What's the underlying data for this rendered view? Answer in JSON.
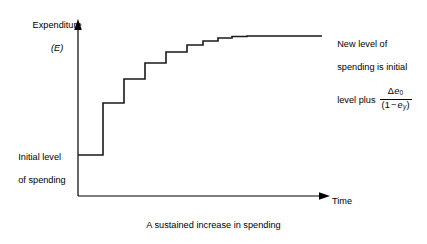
{
  "figure": {
    "caption": "A sustained increase in spending",
    "axes": {
      "y_label_line1": "Expenditure",
      "y_label_line2": "(E)",
      "y_symbol": "E",
      "x_label": "Time",
      "axis_color": "#000000",
      "origin_x": 78,
      "origin_y": 196,
      "y_axis_top": 20,
      "x_axis_right": 330
    },
    "labels": {
      "initial_level": "Initial level\nof spending",
      "initial_level_line1": "Initial level",
      "initial_level_line2": "of spending",
      "annotation_line1": "New level of",
      "annotation_line2": "spending is initial",
      "annotation_line3": "level plus",
      "formula_numerator": "Δe₀",
      "formula_denominator": "(1 − eᵧ)",
      "formula_numerator_symbol": "Δe",
      "formula_numerator_subscript": "0",
      "formula_denominator_prefix": "(1 − e",
      "formula_denominator_subscript": "y",
      "formula_denominator_suffix": ")"
    },
    "leader_line": {
      "from_x": 247,
      "to_x": 322,
      "y": 36
    },
    "curve": {
      "color": "#1a1a1a",
      "stroke_width": 1.6,
      "description": "Step function: expenditure rises in geometrically decaying increments from an initial plateau to a new higher plateau"
    }
  },
  "chart_data": {
    "type": "line",
    "title": "A sustained increase in spending",
    "xlabel": "Time",
    "ylabel": "Expenditure (E)",
    "grid": false,
    "legend": "none",
    "series": [
      {
        "name": "Expenditure path",
        "step": "post",
        "points_px": [
          {
            "x": 78,
            "y": 155
          },
          {
            "x": 103,
            "y": 155
          },
          {
            "x": 103,
            "y": 103
          },
          {
            "x": 124,
            "y": 103
          },
          {
            "x": 124,
            "y": 79
          },
          {
            "x": 145,
            "y": 79
          },
          {
            "x": 145,
            "y": 63
          },
          {
            "x": 166,
            "y": 63
          },
          {
            "x": 166,
            "y": 52
          },
          {
            "x": 187,
            "y": 52
          },
          {
            "x": 187,
            "y": 45
          },
          {
            "x": 203,
            "y": 45
          },
          {
            "x": 203,
            "y": 41
          },
          {
            "x": 218,
            "y": 41
          },
          {
            "x": 218,
            "y": 38
          },
          {
            "x": 232,
            "y": 38
          },
          {
            "x": 232,
            "y": 36.5
          },
          {
            "x": 247,
            "y": 36.5
          },
          {
            "x": 247,
            "y": 36
          },
          {
            "x": 322,
            "y": 36
          }
        ],
        "step_levels_relative": [
          0,
          1.0,
          1.46,
          1.77,
          1.98,
          2.12,
          2.19,
          2.25,
          2.28,
          2.29
        ],
        "initial_level": 0,
        "final_level": 2.29
      }
    ],
    "annotations": [
      {
        "text": "Initial level of spending",
        "target_px": {
          "x": 90,
          "y": 155
        }
      },
      {
        "text": "New level of spending is initial level plus Δe₀/(1 − eᵧ)",
        "target_px": {
          "x": 247,
          "y": 36
        }
      }
    ]
  }
}
